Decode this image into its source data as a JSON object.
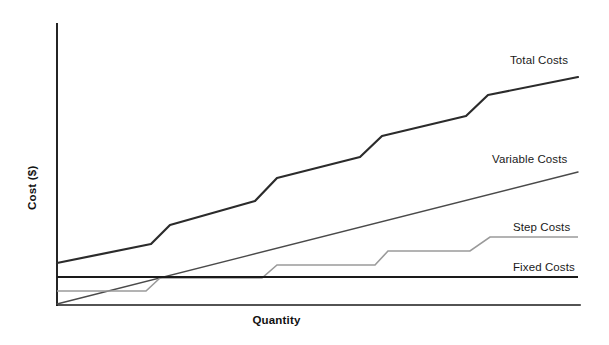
{
  "chart_data": {
    "type": "line",
    "title": "",
    "xlabel": "Quantity",
    "ylabel": "Cost ($)",
    "grid": false,
    "legend_position": "right-inline-labels",
    "axis_color": "#1a1a1a",
    "background": "#ffffff",
    "xlim": [
      0,
      100
    ],
    "ylim": [
      0,
      100
    ],
    "axis_ticks": "none",
    "series": [
      {
        "name": "Total Costs",
        "label": "Total Costs",
        "color": "#2b2b2b",
        "width": 2.2,
        "shape": "stepped-rising",
        "description": "Fixed costs plus variable costs plus step costs; rises with periodic vertical jumps",
        "points": [
          [
            0.0,
            15.3
          ],
          [
            34.6,
            22.0
          ],
          [
            43.7,
            28.8
          ],
          [
            38.1,
            23.4
          ],
          [
            76.1,
            37.5
          ],
          [
            84.5,
            45.4
          ],
          [
            80.0,
            40.6
          ],
          [
            118.0,
            56.0
          ],
          [
            126.0,
            63.5
          ],
          [
            122.0,
            59.0
          ],
          [
            159.0,
            74.7
          ],
          [
            166.0,
            82.0
          ],
          [
            163.0,
            77.8
          ],
          [
            200.0,
            91.3
          ]
        ],
        "px_points": [
          [
            57,
            263
          ],
          [
            151,
            244
          ],
          [
            170,
            225
          ],
          [
            255,
            201
          ],
          [
            277,
            178
          ],
          [
            360,
            157
          ],
          [
            382,
            136
          ],
          [
            466,
            116
          ],
          [
            488,
            95
          ],
          [
            578,
            77
          ]
        ]
      },
      {
        "name": "Variable Costs",
        "label": "Variable Costs",
        "color": "#4a4a4a",
        "width": 1.4,
        "shape": "linear-through-origin",
        "description": "Straight line from origin rising proportionally with quantity",
        "points": [
          [
            0,
            0
          ],
          [
            100,
            52
          ]
        ],
        "px_points": [
          [
            57,
            304
          ],
          [
            578,
            172
          ]
        ]
      },
      {
        "name": "Step Costs",
        "label": "Step Costs",
        "color": "#9a9a9a",
        "width": 1.6,
        "shape": "step",
        "description": "Flat plateaus with short rising transitions at each capacity threshold",
        "points": [
          [
            0,
            5
          ],
          [
            17,
            5
          ],
          [
            21,
            10
          ],
          [
            39,
            10
          ],
          [
            43,
            15
          ],
          [
            61,
            15
          ],
          [
            64,
            20
          ],
          [
            79,
            20
          ],
          [
            83,
            25
          ],
          [
            100,
            25
          ]
        ],
        "px_points": [
          [
            57,
            291
          ],
          [
            146,
            291
          ],
          [
            160,
            278
          ],
          [
            262,
            278
          ],
          [
            277,
            265
          ],
          [
            375,
            265
          ],
          [
            388,
            251
          ],
          [
            470,
            251
          ],
          [
            490,
            237
          ],
          [
            578,
            237
          ]
        ]
      },
      {
        "name": "Fixed Costs",
        "label": "Fixed Costs",
        "color": "#1a1a1a",
        "width": 2.0,
        "shape": "horizontal-constant",
        "description": "Constant horizontal line independent of quantity",
        "points": [
          [
            0,
            14
          ],
          [
            100,
            14
          ]
        ],
        "px_points": [
          [
            57,
            277
          ],
          [
            578,
            277
          ]
        ]
      }
    ],
    "axes": {
      "y_axis_px": [
        57,
        24,
        57,
        305
      ],
      "x_axis_px": [
        57,
        305,
        580,
        305
      ]
    }
  },
  "labels": {
    "y_axis_title": "Cost ($)",
    "x_axis_title": "Quantity",
    "total_costs": "Total Costs",
    "variable_costs": "Variable Costs",
    "step_costs": "Step Costs",
    "fixed_costs": "Fixed Costs"
  }
}
